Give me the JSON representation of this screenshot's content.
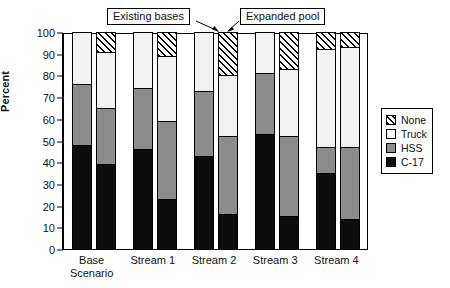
{
  "chart_data": {
    "type": "bar",
    "subtype": "stacked-grouped",
    "title": "",
    "xlabel": "",
    "ylabel": "Percent",
    "ylim": [
      0,
      100
    ],
    "yticks": [
      0,
      10,
      20,
      30,
      40,
      50,
      60,
      70,
      80,
      90,
      100
    ],
    "ytick_labels": [
      "0",
      "10",
      "20",
      "30",
      "40",
      "50",
      "60",
      "70",
      "80",
      "90",
      "100"
    ],
    "grid": false,
    "legend_position": "right",
    "categories": [
      "Base Scenario",
      "Stream 1",
      "Stream 2",
      "Stream 3",
      "Stream 4"
    ],
    "subgroups": [
      "Existing bases",
      "Expanded pool"
    ],
    "series": [
      {
        "name": "C-17",
        "color": "#0d0d0d",
        "pattern": "solid",
        "values": {
          "Existing bases": [
            48,
            46,
            43,
            53,
            35
          ],
          "Expanded pool": [
            39,
            23,
            16,
            15,
            14
          ]
        }
      },
      {
        "name": "HSS",
        "color": "#8c8c8c",
        "pattern": "solid",
        "values": {
          "Existing bases": [
            28,
            28,
            30,
            28,
            12
          ],
          "Expanded pool": [
            26,
            36,
            36,
            37,
            33
          ]
        }
      },
      {
        "name": "Truck",
        "color": "#f2f2f2",
        "pattern": "solid",
        "values": {
          "Existing bases": [
            24,
            26,
            27,
            19,
            45
          ],
          "Expanded pool": [
            26,
            30,
            28,
            31,
            46
          ]
        }
      },
      {
        "name": "None",
        "color": "#ffffff",
        "pattern": "diagonal-hatch",
        "values": {
          "Existing bases": [
            0,
            0,
            0,
            0,
            8
          ],
          "Expanded pool": [
            9,
            11,
            20,
            17,
            7
          ]
        }
      }
    ],
    "cumulative_tops": {
      "Existing bases": {
        "Base Scenario": [
          48,
          76,
          100,
          100
        ],
        "Stream 1": [
          46,
          74,
          100,
          100
        ],
        "Stream 2": [
          43,
          73,
          100,
          100
        ],
        "Stream 3": [
          53,
          81,
          100,
          100
        ],
        "Stream 4": [
          35,
          47,
          92,
          100
        ]
      },
      "Expanded pool": {
        "Base Scenario": [
          39,
          65,
          91,
          100
        ],
        "Stream 1": [
          23,
          59,
          89,
          100
        ],
        "Stream 2": [
          16,
          52,
          80,
          100
        ],
        "Stream 3": [
          15,
          52,
          83,
          100
        ],
        "Stream 4": [
          14,
          47,
          93,
          100
        ]
      }
    },
    "annotations": [
      {
        "text": "Existing bases",
        "points_to": "Base Scenario left bar of Stream 2 group"
      },
      {
        "text": "Expanded pool",
        "points_to": "right bar of Stream 2 group"
      }
    ]
  },
  "legend": {
    "items": [
      {
        "label": "None",
        "swatch": "hatch-swatch"
      },
      {
        "label": "Truck",
        "swatch": "white-swatch"
      },
      {
        "label": "HSS",
        "swatch": "gray-swatch"
      },
      {
        "label": "C-17",
        "swatch": "black-swatch"
      }
    ]
  },
  "axis": {
    "ylabel": "Percent",
    "yticks": [
      "100",
      "90",
      "80",
      "70",
      "60",
      "50",
      "40",
      "30",
      "20",
      "10",
      "0"
    ],
    "xticks": [
      {
        "line1": "Base",
        "line2": "Scenario"
      },
      {
        "line1": "Stream 1",
        "line2": ""
      },
      {
        "line1": "Stream 2",
        "line2": ""
      },
      {
        "line1": "Stream 3",
        "line2": ""
      },
      {
        "line1": "Stream 4",
        "line2": ""
      }
    ]
  },
  "callouts": {
    "existing": "Existing bases",
    "expanded": "Expanded pool"
  }
}
